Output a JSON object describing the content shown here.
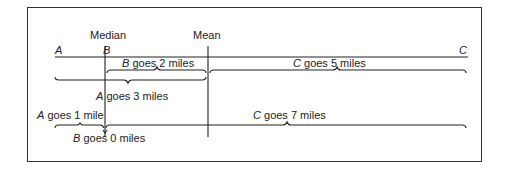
{
  "diagram": {
    "headers": {
      "median": "Median",
      "mean": "Mean"
    },
    "points": {
      "a": "A",
      "b": "B",
      "c": "C"
    },
    "top_row": {
      "b_var": "B",
      "b_text": " goes 2 miles",
      "c_var": "C",
      "c_text": " goes 5 miles",
      "a_var": "A",
      "a_text": " goes 3 miles"
    },
    "bottom_row": {
      "a_var": "A",
      "a_text": " goes 1 mile",
      "c_var": "C",
      "c_text": " goes 7 miles",
      "b_var": "B",
      "b_text": " goes 0 miles"
    },
    "colors": {
      "line": "#222222",
      "background": "#ffffff"
    }
  }
}
